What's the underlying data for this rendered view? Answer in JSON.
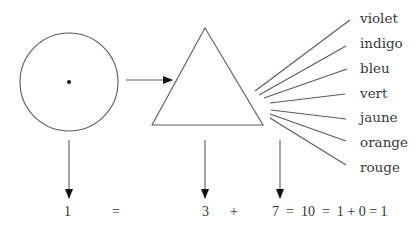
{
  "diagram": {
    "title": "",
    "colors": {
      "line": "#5a5a5a",
      "text": "#3a3a3a",
      "arrowhead": "#111111",
      "background": "#ffffff"
    },
    "nodes": [
      {
        "id": "circle",
        "shape": "circle-with-center-dot"
      },
      {
        "id": "prism",
        "shape": "triangle"
      }
    ],
    "spectrum_labels": [
      "violet",
      "indigo",
      "bleu",
      "vert",
      "jaune",
      "orange",
      "rouge"
    ],
    "equation": {
      "terms": [
        {
          "id": "t1",
          "text": "1"
        },
        {
          "id": "eq1",
          "text": "="
        },
        {
          "id": "t3",
          "text": "3"
        },
        {
          "id": "plus1",
          "text": "+"
        },
        {
          "id": "t7",
          "text": "7"
        },
        {
          "id": "rest",
          "text": "=  10  =  1 + 0 = 1"
        }
      ]
    }
  }
}
